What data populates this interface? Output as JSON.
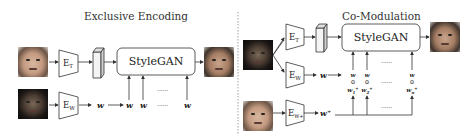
{
  "left_panel": {
    "title": "Exclusive Encoding",
    "encoder_t": {
      "main": "E",
      "sub": "T"
    },
    "encoder_w": {
      "main": "E",
      "sub": "W"
    },
    "generator": "StyleGAN",
    "latent": "w",
    "style_inputs": [
      "w",
      "w",
      "w"
    ],
    "ellipsis": "......"
  },
  "right_panel": {
    "title": "Co-Modulation",
    "encoder_t": {
      "main": "E",
      "sub": "T"
    },
    "encoder_w": {
      "main": "E",
      "sub": "W"
    },
    "encoder_wplus": {
      "main": "E",
      "sub": "W+"
    },
    "generator": "StyleGAN",
    "latent": "w",
    "latent_plus": "w⁺",
    "operator": "⊙",
    "style_columns": [
      {
        "top": "w",
        "bottom_main": "w",
        "bottom_sub": "1",
        "bottom_sup": "+"
      },
      {
        "top": "w",
        "bottom_main": "w",
        "bottom_sub": "2",
        "bottom_sup": "+"
      },
      {
        "top": "w",
        "bottom_main": "w",
        "bottom_sub": "n",
        "bottom_sup": "+"
      }
    ],
    "ellipsis": "......"
  },
  "colors": {
    "line": "#333333",
    "box_fill": "#ffffff",
    "divider": "#888888",
    "feature_block": "#e8e8e8"
  }
}
